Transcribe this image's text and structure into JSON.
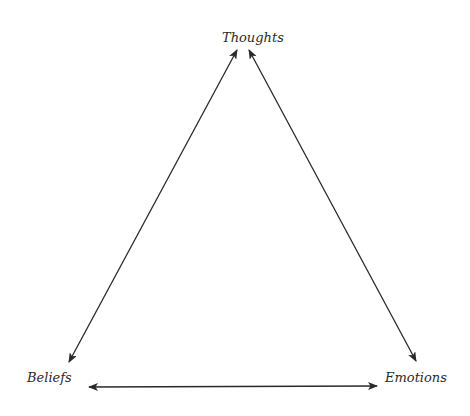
{
  "diagram": {
    "type": "triangle-cycle",
    "nodes": [
      {
        "id": "thoughts",
        "label": "Thoughts",
        "position": "top"
      },
      {
        "id": "beliefs",
        "label": "Beliefs",
        "position": "bottom-left"
      },
      {
        "id": "emotions",
        "label": "Emotions",
        "position": "bottom-right"
      }
    ],
    "edges": [
      {
        "from": "thoughts",
        "to": "beliefs",
        "direction": "bidirectional"
      },
      {
        "from": "thoughts",
        "to": "emotions",
        "direction": "bidirectional"
      },
      {
        "from": "beliefs",
        "to": "emotions",
        "direction": "bidirectional"
      }
    ],
    "colors": {
      "line": "#2a2a2a",
      "text": "#2a2a2a",
      "background": "#ffffff"
    }
  }
}
